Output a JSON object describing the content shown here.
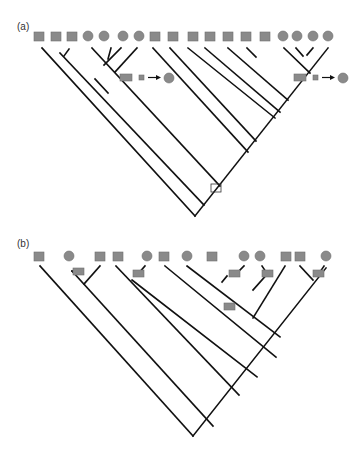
{
  "figure": {
    "panels": [
      {
        "label": "(a)",
        "tips": [
          "square",
          "square",
          "square",
          "circle",
          "circle",
          "circle",
          "circle",
          "square",
          "square",
          "square",
          "square",
          "square",
          "square",
          "square",
          "circle",
          "circle",
          "circle",
          "circle"
        ],
        "legend_transitions": [
          {
            "from": "square",
            "to": "circle",
            "notation": "square → circle"
          },
          {
            "from": "square",
            "to": "circle",
            "notation": "square → circle"
          }
        ],
        "root_marker": "open-square"
      },
      {
        "label": "(b)",
        "tips": [
          "square",
          "circle",
          "square",
          "square",
          "circle",
          "square",
          "circle",
          "square",
          "circle",
          "circle",
          "square",
          "square",
          "circle"
        ],
        "branch_markers": 6
      }
    ],
    "colors": {
      "shape_fill": "#8a8a8a",
      "shape_stroke": "#6e6e6e",
      "line": "#111111",
      "background": "#ffffff"
    }
  }
}
